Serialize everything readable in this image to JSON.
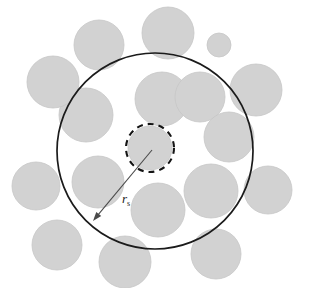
{
  "figure": {
    "background_color": "#ffffff",
    "width": 316,
    "height": 288
  },
  "labels": {
    "radius_symbol": "r",
    "radius_subscript": "s",
    "radius_label_full": "r_s"
  },
  "colors": {
    "disk_fill": "#d2d2d2",
    "disk_edge": "#c6c6c6",
    "outline_stroke": "#1b1b1b",
    "dashed_stroke": "#141414",
    "arrow_stroke": "#4a4a4a",
    "label_text": "#1b1b1b",
    "background": "#ffffff"
  },
  "chart_data": {
    "type": "scatter",
    "xlabel": "",
    "ylabel": "",
    "xlim": [
      0,
      316
    ],
    "ylim": [
      0,
      288
    ],
    "grid": false,
    "legend": null,
    "shapes": {
      "large_circle": {
        "name": "sphere-boundary",
        "cx": 155,
        "cy": 151,
        "r": 98,
        "style": "solid",
        "stroke_width": 1.7,
        "fill": "none"
      },
      "dashed_circle": {
        "name": "central-cell-boundary",
        "cx": 150,
        "cy": 148,
        "r": 24,
        "style": "dashed",
        "stroke_width": 2.1,
        "dash_pattern": "6 5",
        "fill": "none"
      },
      "radius_arrow": {
        "name": "radius-arrow",
        "x1": 152,
        "y1": 150,
        "x2": 93,
        "y2": 221,
        "stroke_width": 1.1,
        "arrowhead_at": "end"
      },
      "radius_label_position": {
        "x": 122,
        "y": 203
      }
    },
    "disks": [
      {
        "id": 1,
        "cx": 150,
        "cy": 148,
        "r": 22,
        "inside": true,
        "note": "central disk"
      },
      {
        "id": 2,
        "cx": 162,
        "cy": 99,
        "r": 27,
        "inside": true
      },
      {
        "id": 3,
        "cx": 86,
        "cy": 115,
        "r": 27,
        "inside": true
      },
      {
        "id": 4,
        "cx": 200,
        "cy": 97,
        "r": 25,
        "inside": true
      },
      {
        "id": 5,
        "cx": 229,
        "cy": 137,
        "r": 25,
        "inside": true
      },
      {
        "id": 6,
        "cx": 98,
        "cy": 182,
        "r": 26,
        "inside": true
      },
      {
        "id": 7,
        "cx": 211,
        "cy": 191,
        "r": 27,
        "inside": true
      },
      {
        "id": 8,
        "cx": 158,
        "cy": 210,
        "r": 27,
        "inside": true
      },
      {
        "id": 9,
        "cx": 99,
        "cy": 45,
        "r": 25,
        "inside": false
      },
      {
        "id": 10,
        "cx": 168,
        "cy": 33,
        "r": 26,
        "inside": false
      },
      {
        "id": 11,
        "cx": 53,
        "cy": 82,
        "r": 26,
        "inside": false
      },
      {
        "id": 12,
        "cx": 256,
        "cy": 90,
        "r": 26,
        "inside": false
      },
      {
        "id": 13,
        "cx": 36,
        "cy": 186,
        "r": 24,
        "inside": false
      },
      {
        "id": 14,
        "cx": 268,
        "cy": 190,
        "r": 24,
        "inside": false
      },
      {
        "id": 15,
        "cx": 57,
        "cy": 245,
        "r": 25,
        "inside": false
      },
      {
        "id": 16,
        "cx": 125,
        "cy": 262,
        "r": 26,
        "inside": false
      },
      {
        "id": 17,
        "cx": 216,
        "cy": 254,
        "r": 25,
        "inside": false
      },
      {
        "id": 18,
        "cx": 219,
        "cy": 45,
        "r": 12,
        "inside": false
      }
    ]
  }
}
